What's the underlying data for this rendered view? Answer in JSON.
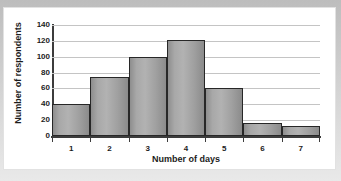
{
  "chart_data": {
    "type": "bar",
    "title": "",
    "xlabel": "Number of days",
    "ylabel": "Number of respondents",
    "categories": [
      "1",
      "2",
      "3",
      "4",
      "5",
      "6",
      "7"
    ],
    "values": [
      40,
      75,
      100,
      121,
      60,
      16,
      13
    ],
    "ylim": [
      0,
      140
    ],
    "ytick_labels": [
      "0",
      "20",
      "40",
      "60",
      "80",
      "100",
      "120",
      "140"
    ],
    "ytick_values": [
      0,
      20,
      40,
      60,
      80,
      100,
      120,
      140
    ],
    "grid": "horizontal",
    "legend": "none",
    "bar_color": "#a6a6a6",
    "bar_edge_color": "#272727",
    "gridline_color": "#c4c4c4",
    "axis_color": "#3c3c3c",
    "background_color": "#ffffff",
    "frame_color": "#cccccc"
  }
}
